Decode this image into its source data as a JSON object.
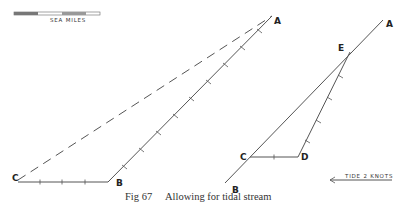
{
  "scale_bar": {
    "label": "SEA MILES"
  },
  "left_figure": {
    "labels": {
      "A": "A",
      "B": "B",
      "C": "C"
    }
  },
  "right_figure": {
    "labels": {
      "A": "A",
      "B": "B",
      "C": "C",
      "D": "D",
      "E": "E"
    }
  },
  "tide_arrow": {
    "label": "TIDE 2 KNOTS"
  },
  "caption": {
    "figure_number": "Fig 67",
    "text": "Allowing for tidal stream"
  }
}
